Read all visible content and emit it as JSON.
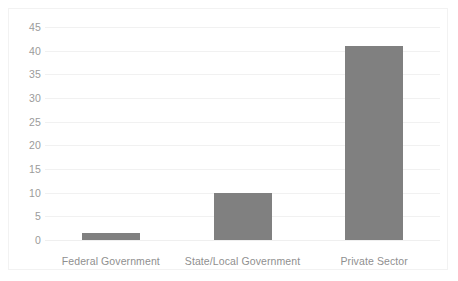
{
  "chart_data": {
    "type": "bar",
    "title": "",
    "subtitle": "",
    "xlabel": "",
    "ylabel": "",
    "categories": [
      "Federal Government",
      "State/Local Government",
      "Private Sector"
    ],
    "values": [
      1.5,
      10,
      41
    ],
    "series": [
      {
        "name": "",
        "values": [
          1.5,
          10,
          41
        ]
      }
    ],
    "ylim": [
      0,
      45
    ],
    "ytick_labels": [
      "0",
      "5",
      "10",
      "15",
      "20",
      "25",
      "30",
      "35",
      "40",
      "45"
    ],
    "ytick_values": [
      0,
      5,
      10,
      15,
      20,
      25,
      30,
      35,
      40,
      45
    ],
    "grid": true,
    "grid_axis": "y",
    "legend": false,
    "legend_position": "none",
    "annotations": [],
    "bar_color": "#808080",
    "gridline_color": "#f1f1f1",
    "background_color": "#ffffff",
    "border_color": "#f2f2f2",
    "tick_label_color": "#9b9b9b"
  }
}
